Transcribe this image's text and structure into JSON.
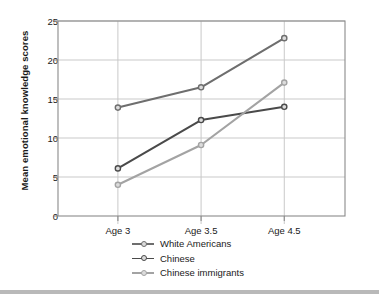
{
  "chart_data": {
    "type": "line",
    "title": "",
    "xlabel": "",
    "ylabel": "Mean emotional knowledge scores",
    "categories": [
      "Age 3",
      "Age 3.5",
      "Age 4.5"
    ],
    "ylim": [
      0,
      25
    ],
    "yticks": [
      0,
      5,
      10,
      15,
      20,
      25
    ],
    "grid": "horizontal-and-vertical",
    "legend_position": "below-axis",
    "series": [
      {
        "name": "White Americans",
        "color": "#6e6e6e",
        "values": [
          13.9,
          16.5,
          22.8
        ]
      },
      {
        "name": "Chinese",
        "color": "#4a4a4a",
        "values": [
          6.1,
          12.3,
          14.0
        ]
      },
      {
        "name": "Chinese immigrants",
        "color": "#a3a3a3",
        "values": [
          4.0,
          9.1,
          17.1
        ]
      }
    ]
  },
  "axis": {
    "y_tick_labels": [
      "0",
      "5",
      "10",
      "15",
      "20",
      "25"
    ],
    "x_tick_labels": [
      "Age 3",
      "Age 3.5",
      "Age 4.5"
    ],
    "y_title": "Mean emotional knowledge scores"
  },
  "legend": {
    "items": [
      {
        "label": "White Americans"
      },
      {
        "label": "Chinese"
      },
      {
        "label": "Chinese immigrants"
      }
    ]
  },
  "style": {
    "frame_color": "#8a8a8a",
    "grid_color": "#c9c9c9",
    "text_color": "#1a1a1a",
    "background": "#ffffff",
    "bottom_bar_color": "#b9b9b9"
  }
}
